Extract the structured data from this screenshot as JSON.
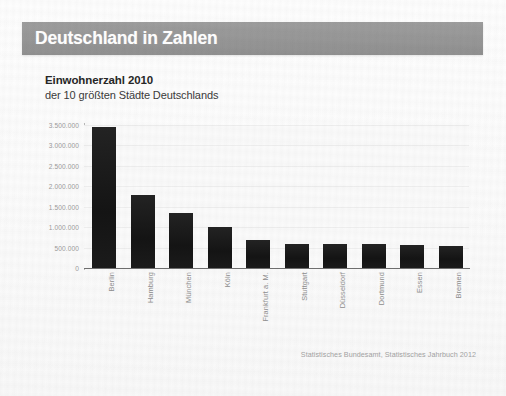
{
  "header": {
    "title": "Deutschland in Zahlen",
    "band_color": "#979797",
    "title_color": "#ffffff"
  },
  "source_note": "Statistisches Bundesamt, Statistisches Jahrbuch 2012",
  "chart_data": {
    "type": "bar",
    "title": "Einwohnerzahl 2010",
    "subtitle": "der 10 größten Städte Deutschlands",
    "xlabel": "",
    "ylabel": "",
    "ylim": [
      0,
      3500000
    ],
    "grid": true,
    "legend": "none",
    "bar_color": "#1c1c1c",
    "ytick_labels": [
      "3.500.000",
      "3.000.000",
      "2.500.000",
      "2.000.000",
      "1.500.000",
      "1.000.000",
      "500.000",
      "0"
    ],
    "ytick_values": [
      3500000,
      3000000,
      2500000,
      2000000,
      1500000,
      1000000,
      500000,
      0
    ],
    "categories": [
      "Berlin",
      "Hamburg",
      "München",
      "Köln",
      "Frankfurt a. M.",
      "Stuttgart",
      "Düsseldorf",
      "Dortmund",
      "Essen",
      "Bremen"
    ],
    "values": [
      3460000,
      1790000,
      1350000,
      1000000,
      680000,
      600000,
      590000,
      580000,
      575000,
      548000
    ]
  }
}
